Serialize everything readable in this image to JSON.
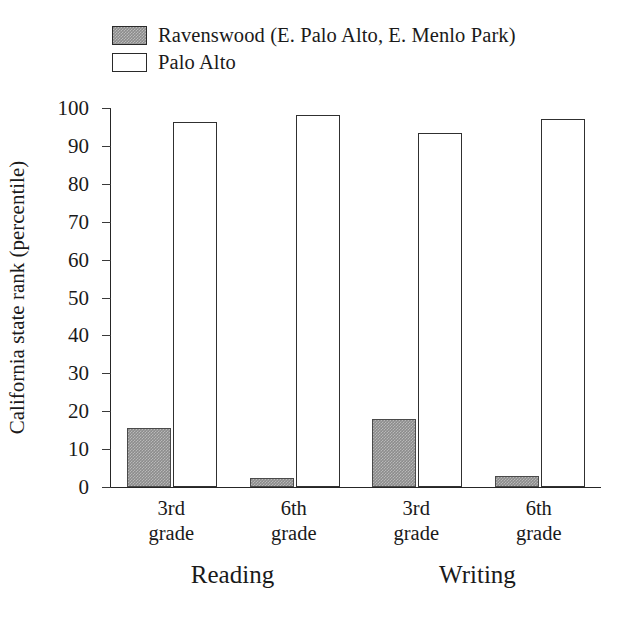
{
  "chart_data": {
    "type": "bar",
    "title": "",
    "xlabel": "",
    "ylabel": "California state rank (percentile)",
    "ylim": [
      0,
      100
    ],
    "yticks": [
      0,
      10,
      20,
      30,
      40,
      50,
      60,
      70,
      80,
      90,
      100
    ],
    "grid": false,
    "legend_position": "top-left",
    "categories": [
      "3rd\ngrade",
      "6th\ngrade",
      "3rd\ngrade",
      "6th\ngrade"
    ],
    "groups": [
      {
        "label": "Reading",
        "categories": [
          "3rd\ngrade",
          "6th\ngrade"
        ]
      },
      {
        "label": "Writing",
        "categories": [
          "3rd\ngrade",
          "6th\ngrade"
        ]
      }
    ],
    "series": [
      {
        "name": "Ravenswood (E. Palo Alto, E. Menlo Park)",
        "color": "#8c8c8c",
        "fill": "gray-hatched",
        "values": [
          15.5,
          2.5,
          18,
          3
        ]
      },
      {
        "name": "Palo Alto",
        "color": "#ffffff",
        "fill": "white-outlined",
        "values": [
          96.3,
          98.2,
          93.3,
          97
        ]
      }
    ]
  },
  "legend": {
    "items": [
      {
        "label": "Ravenswood (E. Palo Alto, E. Menlo Park)",
        "swatch": "filled"
      },
      {
        "label": "Palo Alto",
        "swatch": "hollow"
      }
    ]
  },
  "axes": {
    "y_title": "California state rank (percentile)",
    "y_tick_labels": [
      "100",
      "90",
      "80",
      "70",
      "60",
      "50",
      "40",
      "30",
      "20",
      "10",
      "0"
    ],
    "category_labels": [
      "3rd\ngrade",
      "6th\ngrade",
      "3rd\ngrade",
      "6th\ngrade"
    ],
    "group_labels": [
      "Reading",
      "Writing"
    ]
  },
  "colors": {
    "series_ravenswood": "#8c8c8c",
    "series_paloalto": "#ffffff",
    "axis": "#262626",
    "text": "#1a1a1a",
    "background": "#ffffff"
  }
}
